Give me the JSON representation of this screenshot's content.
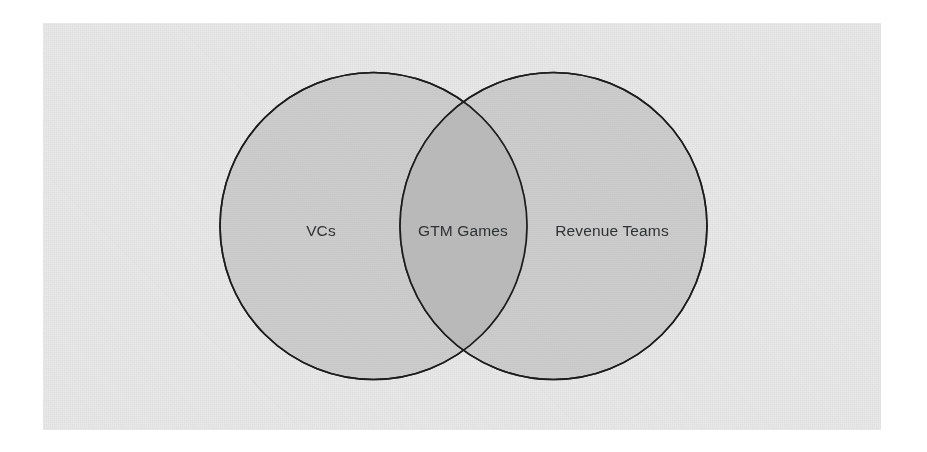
{
  "diagram": {
    "type": "venn",
    "title": "",
    "background_color": "#ffffff",
    "canvas_color": "#e9e9e9",
    "circle_fill_color": "#b4b4b4",
    "circle_fill_opacity": "0.55",
    "intersection_color": "#9c9c9c",
    "stroke_color": "#1c1c1c",
    "label_color": "#2f3133",
    "sets": [
      {
        "id": "left",
        "label": "VCs",
        "label_x": 321,
        "label_y": 236,
        "center_x": 373.5,
        "center_y": 226,
        "radius": 153.5
      },
      {
        "id": "right",
        "label": "Revenue Teams",
        "label_x": 612,
        "label_y": 236,
        "center_x": 553.5,
        "center_y": 226,
        "radius": 153.5
      }
    ],
    "intersection": {
      "id": "overlap",
      "label": "GTM Games",
      "label_x": 463,
      "label_y": 236
    }
  }
}
